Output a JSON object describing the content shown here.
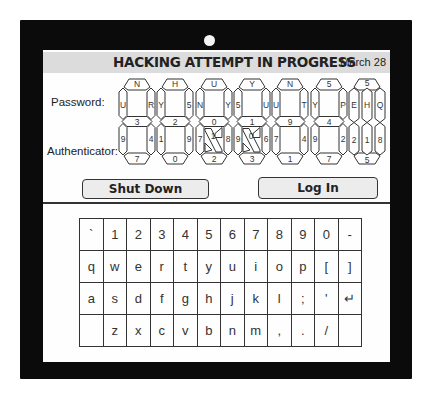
{
  "screen": {
    "title": "HACKING ATTEMPT IN PROGRESS",
    "date": "March 28"
  },
  "labels": {
    "password": "Password:",
    "authenticator": "Authenticator:"
  },
  "displays": [
    {
      "type": "wide",
      "top": "N",
      "ul": "U",
      "ur": "R",
      "mid": "3",
      "ll": "9",
      "lr": "4",
      "bottom": "7",
      "diag": null
    },
    {
      "type": "wide",
      "top": "H",
      "ul": "Y",
      "ur": "5",
      "mid": "2",
      "ll": "1",
      "lr": "9",
      "bottom": "0",
      "diag": null
    },
    {
      "type": "wide",
      "top": "U",
      "ul": "N",
      "ur": "Y",
      "mid": "0",
      "ll": "7",
      "lr": "8",
      "bottom": "2",
      "diag": "1"
    },
    {
      "type": "wide",
      "top": "Y",
      "ul": "5",
      "ur": "U",
      "mid": "1",
      "ll": "9",
      "lr": "6",
      "bottom": "3",
      "diag": "0"
    },
    {
      "type": "wide",
      "top": "N",
      "ul": "U",
      "ur": "T",
      "mid": "9",
      "ll": "7",
      "lr": "4",
      "bottom": "1",
      "diag": null
    },
    {
      "type": "wide",
      "top": "5",
      "ul": "Y",
      "ur": "P",
      "mid": "4",
      "ll": "9",
      "lr": "2",
      "bottom": "7",
      "diag": null
    },
    {
      "type": "narrow",
      "top": "5",
      "cols_upper": [
        "E",
        "H",
        "Q"
      ],
      "cols_lower": [
        "2",
        "1",
        "8"
      ],
      "bottom": "5"
    }
  ],
  "buttons": {
    "shutdown": "Shut Down",
    "login": "Log In"
  },
  "keyboard": {
    "rows": [
      [
        "`",
        "1",
        "2",
        "3",
        "4",
        "5",
        "6",
        "7",
        "8",
        "9",
        "0",
        "-"
      ],
      [
        "q",
        "w",
        "e",
        "r",
        "t",
        "y",
        "u",
        "i",
        "o",
        "p",
        "[",
        "]"
      ],
      [
        "a",
        "s",
        "d",
        "f",
        "g",
        "h",
        "j",
        "k",
        "l",
        ";",
        "'",
        "↵"
      ],
      [
        "",
        "z",
        "x",
        "c",
        "v",
        "b",
        "n",
        "m",
        ",",
        ".",
        "/",
        ""
      ]
    ]
  }
}
